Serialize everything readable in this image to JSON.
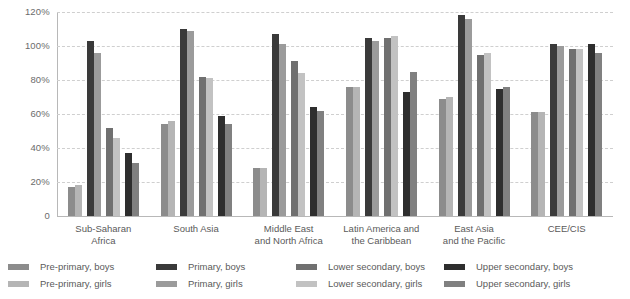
{
  "chart_data": {
    "type": "bar",
    "title": "",
    "subtitle": "",
    "xlabel": "",
    "ylabel": "",
    "ylim": [
      0,
      120
    ],
    "grid": true,
    "legend_position": "bottom",
    "y_ticks": [
      "0",
      "20%",
      "40%",
      "60%",
      "80%",
      "100%",
      "120%"
    ],
    "y_tick_values": [
      0,
      20,
      40,
      60,
      80,
      100,
      120
    ],
    "categories": [
      "Sub-Saharan Africa",
      "South Asia",
      "Middle East and North Africa",
      "Latin America and the Caribbean",
      "East Asia and the Pacific",
      "CEE/CIS"
    ],
    "category_lines": [
      [
        "Sub-Saharan",
        "Africa"
      ],
      [
        "South Asia"
      ],
      [
        "Middle East",
        "and North Africa"
      ],
      [
        "Latin America and",
        "the Caribbean"
      ],
      [
        "East Asia",
        "and the Pacific"
      ],
      [
        "CEE/CIS"
      ]
    ],
    "series": [
      {
        "name": "Pre-primary, boys",
        "color": "#8c8c8c",
        "values": [
          17,
          54,
          28,
          76,
          69,
          61
        ]
      },
      {
        "name": "Pre-primary, girls",
        "color": "#b5b5b5",
        "values": [
          18,
          56,
          28,
          76,
          70,
          61
        ]
      },
      {
        "name": "Primary, boys",
        "color": "#3a3a3a",
        "values": [
          103,
          110,
          107,
          105,
          118,
          101
        ]
      },
      {
        "name": "Primary, girls",
        "color": "#9b9b9b",
        "values": [
          96,
          109,
          101,
          103,
          116,
          100
        ]
      },
      {
        "name": "Lower secondary, boys",
        "color": "#707070",
        "values": [
          52,
          82,
          91,
          105,
          95,
          98
        ]
      },
      {
        "name": "Lower secondary, girls",
        "color": "#c2c2c2",
        "values": [
          46,
          81,
          84,
          106,
          96,
          98
        ]
      },
      {
        "name": "Upper secondary, boys",
        "color": "#2e2e2e",
        "values": [
          37,
          59,
          64,
          73,
          75,
          101
        ]
      },
      {
        "name": "Upper secondary, girls",
        "color": "#808080",
        "values": [
          31,
          54,
          62,
          85,
          76,
          96
        ]
      }
    ]
  },
  "legend": {
    "columns": [
      {
        "items": [
          0,
          1
        ]
      },
      {
        "items": [
          2,
          3
        ]
      },
      {
        "items": [
          4,
          5
        ]
      },
      {
        "items": [
          6,
          7
        ]
      }
    ]
  },
  "colors": {
    "gridline": "#cfcfcf",
    "axis": "#b8b8b8",
    "text": "#5a5a5a",
    "background": "#ffffff"
  }
}
